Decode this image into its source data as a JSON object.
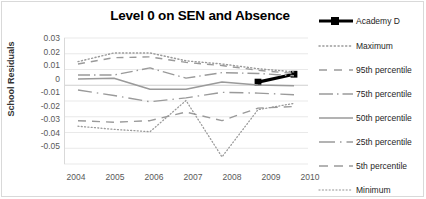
{
  "chart_data": {
    "type": "line",
    "title": "Level 0 on SEN and Absence",
    "xlabel": "",
    "ylabel": "School Residuals",
    "x": [
      2004,
      2005,
      2006,
      2007,
      2008,
      2009,
      2010
    ],
    "categories": [
      "2004",
      "2005",
      "2006",
      "2007",
      "2008",
      "2009",
      "2010"
    ],
    "xticklabels": [
      "2004",
      "2005",
      "2006",
      "2007",
      "2008",
      "2009",
      "2010"
    ],
    "yticklabels": [
      "0.03",
      "0.02",
      "0.01",
      "0",
      "-0.01",
      "-0.02",
      "-0.03",
      "-0.04",
      "-0.05"
    ],
    "ytickvalues": [
      0.03,
      0.02,
      0.01,
      0,
      -0.01,
      -0.02,
      -0.03,
      -0.04,
      -0.05
    ],
    "ylim": [
      -0.05,
      0.03
    ],
    "grid": true,
    "legend_position": "right",
    "series": [
      {
        "name": "Academy D",
        "style": "solid-thick-marker",
        "color": "#000000",
        "x": [
          2009,
          2010
        ],
        "values": [
          0.002,
          0.007
        ]
      },
      {
        "name": "Maximum",
        "style": "dotted",
        "color": "#9a9a9a",
        "values": [
          0.015,
          0.0205,
          0.0205,
          0.0155,
          0.0135,
          0.0105,
          0.0085
        ]
      },
      {
        "name": "95th percentile",
        "style": "dashed",
        "color": "#9a9a9a",
        "values": [
          0.0135,
          0.0175,
          0.018,
          0.0145,
          0.0125,
          0.0095,
          0.0075
        ]
      },
      {
        "name": "75th percentile",
        "style": "dash-dot",
        "color": "#9a9a9a",
        "values": [
          0.0065,
          0.0065,
          0.011,
          0.0045,
          0.008,
          0.0075,
          0.006
        ]
      },
      {
        "name": "50th percentile",
        "style": "solid",
        "color": "#9a9a9a",
        "values": [
          0.004,
          0.0045,
          -0.0025,
          -0.0025,
          0.002,
          0.0002,
          -0.0003
        ]
      },
      {
        "name": "25th  percentile",
        "style": "solid-long-dash",
        "color": "#9a9a9a",
        "values": [
          -0.003,
          -0.0065,
          -0.0105,
          -0.008,
          -0.0045,
          -0.005,
          -0.006
        ]
      },
      {
        "name": "5th percentile",
        "style": "long-dash",
        "color": "#9a9a9a",
        "values": [
          -0.0225,
          -0.0235,
          -0.0225,
          -0.017,
          -0.0225,
          -0.0145,
          -0.0135
        ]
      },
      {
        "name": "Minimum",
        "style": "fine-dotted",
        "color": "#9a9a9a",
        "values": [
          -0.026,
          -0.028,
          -0.0295,
          -0.0097,
          -0.0455,
          -0.0155,
          -0.0115
        ]
      }
    ]
  },
  "legend": {
    "items": [
      {
        "label": "Academy D"
      },
      {
        "label": "Maximum"
      },
      {
        "label": "95th percentile"
      },
      {
        "label": "75th percentile"
      },
      {
        "label": "50th percentile"
      },
      {
        "label": "25th  percentile"
      },
      {
        "label": "5th percentile"
      },
      {
        "label": "Minimum"
      }
    ]
  },
  "colors": {
    "series_gray": "#9a9a9a",
    "academy": "#000000",
    "grid": "#e3e3e3",
    "tick_text": "#595959",
    "border": "#d9d9d9"
  }
}
